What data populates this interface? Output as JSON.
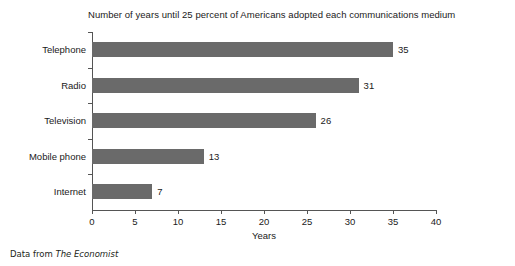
{
  "chart_data": {
    "type": "bar",
    "orientation": "horizontal",
    "title": "Number of years until 25 percent of Americans adopted each communications medium",
    "categories": [
      "Telephone",
      "Radio",
      "Television",
      "Mobile phone",
      "Internet"
    ],
    "values": [
      35,
      31,
      26,
      13,
      7
    ],
    "value_labels": [
      "35",
      "31",
      "26",
      "13",
      "7"
    ],
    "xlabel": "Years",
    "ylabel": "",
    "xlim": [
      0,
      40
    ],
    "xticks": [
      0,
      5,
      10,
      15,
      20,
      25,
      30,
      35,
      40
    ],
    "xtick_labels": [
      "0",
      "5",
      "10",
      "15",
      "20",
      "25",
      "30",
      "35",
      "40"
    ],
    "grid": false,
    "legend": null,
    "bar_color": "#6a6a6a",
    "axis_color": "#555555",
    "background_color": "#ffffff",
    "text_color": "#1a1a1a"
  },
  "footer": {
    "prefix": "Data from ",
    "source": "The Economist"
  }
}
